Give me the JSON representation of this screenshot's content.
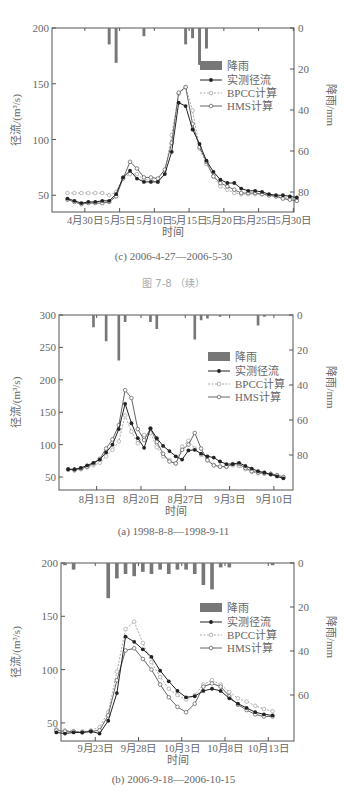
{
  "page": {
    "figure_continued_label": "图 7-8  （续）"
  },
  "chart_data": [
    {
      "id": "c",
      "type": "line",
      "caption": "(c) 2006-4-27—2006-5-30",
      "xlabel": "时间",
      "ylabel": "径流/(m³/s)",
      "y2label": "降雨/mm",
      "ylim": [
        35,
        200
      ],
      "yticks": [
        50,
        100,
        150,
        200
      ],
      "y2lim": [
        0,
        80
      ],
      "y2ticks": [
        0,
        20,
        40,
        60,
        80
      ],
      "x_start": "2006-04-27",
      "xtick_labels": [
        "4月30日",
        "5月5日",
        "5月10日",
        "5月15日",
        "5月20日",
        "5月25日",
        "5月30日"
      ],
      "xtick_days": [
        3,
        8,
        13,
        18,
        23,
        28,
        33
      ],
      "legend": [
        "降雨",
        "实测径流",
        "BPCC计算",
        "HMS计算"
      ],
      "rain": [
        0,
        0,
        0,
        0,
        0,
        0,
        8,
        17,
        0,
        0,
        0,
        4,
        0,
        0,
        0,
        0,
        0,
        8,
        5,
        18,
        10,
        0,
        0,
        0,
        0,
        0,
        0,
        0,
        0,
        0,
        0,
        0,
        0,
        0
      ],
      "series": [
        {
          "name": "实测径流",
          "values": [
            47,
            45,
            43,
            44,
            44,
            45,
            45,
            51,
            66,
            72,
            65,
            62,
            62,
            62,
            69,
            89,
            133,
            130,
            109,
            96,
            81,
            71,
            64,
            61,
            61,
            56,
            54,
            54,
            53,
            51,
            50,
            50,
            49,
            48
          ]
        },
        {
          "name": "BPCC计算",
          "values": [
            52,
            52,
            52,
            52,
            52,
            52,
            50,
            53,
            66,
            69,
            69,
            64,
            64,
            62,
            70,
            104,
            141,
            147,
            126,
            92,
            78,
            67,
            58,
            55,
            52,
            51,
            51,
            51,
            51,
            50,
            49,
            48,
            47,
            47
          ]
        },
        {
          "name": "HMS计算",
          "values": [
            46,
            44,
            42,
            43,
            43,
            43,
            44,
            49,
            65,
            80,
            74,
            66,
            66,
            65,
            73,
            97,
            142,
            147,
            114,
            93,
            80,
            67,
            61,
            58,
            55,
            52,
            52,
            52,
            51,
            50,
            49,
            47,
            46,
            45
          ]
        }
      ]
    },
    {
      "id": "a",
      "type": "line",
      "caption": "(a) 1998-8-8—1998-9-11",
      "xlabel": "时间",
      "ylabel": "径流/(m³/s)",
      "y2label": "降雨/mm",
      "ylim": [
        30,
        300
      ],
      "yticks": [
        50,
        100,
        150,
        200,
        250,
        300
      ],
      "y2lim": [
        0,
        80
      ],
      "y2ticks": [
        0,
        20,
        40,
        60,
        80
      ],
      "x_start": "1998-08-08",
      "xtick_labels": [
        "8月13日",
        "8月20日",
        "8月27日",
        "9月3日",
        "9月10日"
      ],
      "xtick_days": [
        5,
        12,
        19,
        26,
        33
      ],
      "legend": [
        "降雨",
        "实测径流",
        "BPCC计算",
        "HMS计算"
      ],
      "rain": [
        0,
        0,
        0,
        0,
        7,
        0,
        15,
        0,
        26,
        4,
        0,
        0,
        0,
        4,
        8,
        0,
        0,
        0,
        0,
        0,
        14,
        3,
        2,
        0,
        1,
        0,
        0,
        0,
        0,
        0,
        6,
        1,
        0,
        0,
        0
      ],
      "series": [
        {
          "name": "实测径流",
          "values": [
            62,
            62,
            64,
            68,
            72,
            77,
            88,
            100,
            124,
            163,
            133,
            110,
            95,
            125,
            110,
            98,
            90,
            82,
            77,
            91,
            92,
            86,
            82,
            80,
            74,
            70,
            70,
            72,
            67,
            63,
            59,
            57,
            54,
            51,
            48
          ]
        },
        {
          "name": "BPCC计算",
          "values": [
            61,
            60,
            62,
            65,
            68,
            72,
            82,
            92,
            105,
            145,
            120,
            102,
            115,
            118,
            96,
            82,
            76,
            71,
            97,
            106,
            94,
            84,
            76,
            69,
            66,
            66,
            68,
            67,
            62,
            58,
            56,
            55,
            54,
            52,
            50
          ]
        },
        {
          "name": "HMS计算",
          "values": [
            62,
            61,
            63,
            66,
            71,
            78,
            94,
            108,
            130,
            184,
            172,
            124,
            107,
            125,
            104,
            86,
            74,
            71,
            92,
            100,
            118,
            94,
            76,
            68,
            66,
            66,
            70,
            70,
            64,
            59,
            57,
            56,
            55,
            53,
            50
          ]
        }
      ]
    },
    {
      "id": "b",
      "type": "line",
      "caption": "(b) 2006-9-18—2006-10-15",
      "xlabel": "时间",
      "ylabel": "径流/(m³/s)",
      "y2label": "降雨/mm",
      "ylim": [
        33,
        200
      ],
      "yticks": [
        50,
        100,
        150,
        200
      ],
      "y2lim": [
        0,
        60
      ],
      "y2ticks": [
        0,
        20,
        40,
        60
      ],
      "x_start": "2006-09-18",
      "xtick_labels": [
        "9月23日",
        "9月28日",
        "10月3日",
        "10月8日",
        "10月13日"
      ],
      "xtick_days": [
        5,
        10,
        15,
        20,
        25
      ],
      "legend": [
        "降雨",
        "实测径流",
        "BPCC计算",
        "HMS计算"
      ],
      "rain": [
        0,
        1,
        3,
        0,
        0,
        0,
        16,
        7,
        5,
        6,
        4,
        5,
        3,
        5,
        3,
        3,
        5,
        10,
        12,
        2,
        2,
        0,
        0,
        0,
        0,
        1,
        0,
        0
      ],
      "series": [
        {
          "name": "实测径流",
          "values": [
            41,
            40,
            41,
            41,
            42,
            40,
            52,
            78,
            131,
            126,
            119,
            112,
            99,
            89,
            80,
            74,
            75,
            80,
            82,
            80,
            73,
            68,
            64,
            60,
            58,
            57
          ]
        },
        {
          "name": "BPCC计算",
          "values": [
            44,
            43,
            42,
            42,
            43,
            46,
            60,
            98,
            138,
            145,
            125,
            107,
            93,
            82,
            76,
            72,
            76,
            86,
            90,
            86,
            79,
            73,
            70,
            66,
            63,
            61
          ]
        },
        {
          "name": "HMS计算",
          "values": [
            43,
            42,
            42,
            41,
            42,
            43,
            57,
            90,
            118,
            120,
            110,
            100,
            86,
            74,
            65,
            60,
            68,
            84,
            87,
            84,
            75,
            67,
            62,
            58,
            56,
            56
          ]
        }
      ]
    }
  ],
  "colors": {
    "rain_bar": "#777777",
    "observed": "#222222",
    "bpcc": "#aaaaaa",
    "hms": "#666666",
    "axis": "#555555"
  }
}
